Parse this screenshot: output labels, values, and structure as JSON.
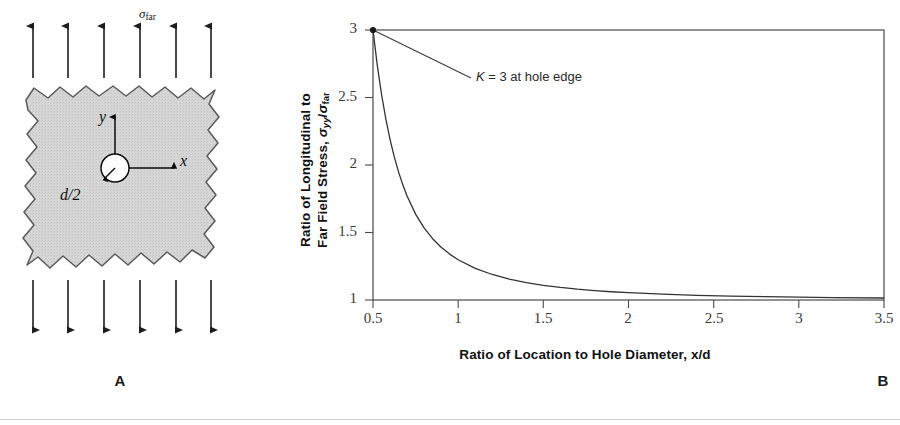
{
  "figure": {
    "panels": [
      {
        "id": "A",
        "label": "A",
        "caption_role": "plate-with-hole-schematic"
      },
      {
        "id": "B",
        "label": "B",
        "caption_role": "stress-ratio-plot"
      }
    ]
  },
  "panel_a": {
    "label": "A",
    "far_field_stress_label": {
      "symbol": "σ",
      "subscript": "far"
    },
    "axis_x_label": "x",
    "axis_y_label": "y",
    "radius_label": "d/2",
    "arrow_count_top": 6,
    "arrow_count_bottom": 6,
    "plate_fill": "#d4d4d4",
    "plate_stroke": "#555555",
    "hole_fill": "#ffffff"
  },
  "panel_b": {
    "label": "B",
    "annotation": {
      "italic_symbol": "K",
      "text": " = 3 at hole edge"
    },
    "marker_point": {
      "x": 0.5,
      "y": 3
    },
    "frame_color": "#4a4a4a",
    "curve_color": "#333333"
  },
  "chart_data": {
    "type": "line",
    "title": "",
    "xlabel_prefix": "Ratio of Location to Hole Diameter, ",
    "xlabel_italic": "x/d",
    "ylabel_line1": "Ratio of Longitudinal to",
    "ylabel_line2_prefix": "Far Field Stress, ",
    "ylabel_sigma": "σ",
    "ylabel_sub1": "yy",
    "ylabel_slash": "/",
    "ylabel_sub2": "far",
    "xlim": [
      0.5,
      3.5
    ],
    "ylim": [
      1,
      3
    ],
    "xticks": [
      "0.5",
      "1",
      "1.5",
      "2",
      "2.5",
      "3",
      "3.5"
    ],
    "xtick_values": [
      0.5,
      1,
      1.5,
      2,
      2.5,
      3,
      3.5
    ],
    "yticks": [
      "1",
      "1.5",
      "2",
      "2.5",
      "3"
    ],
    "ytick_values": [
      1,
      1.5,
      2,
      2.5,
      3
    ],
    "grid": false,
    "legend": null,
    "annotations": [
      {
        "text": "K = 3 at hole edge",
        "points_to": [
          0.5,
          3
        ]
      }
    ],
    "series": [
      {
        "name": "sigma_yy / sigma_far",
        "x": [
          0.5,
          0.525,
          0.55,
          0.575,
          0.6,
          0.625,
          0.65,
          0.675,
          0.7,
          0.75,
          0.8,
          0.85,
          0.9,
          0.95,
          1.0,
          1.1,
          1.2,
          1.3,
          1.4,
          1.5,
          1.6,
          1.7,
          1.8,
          1.9,
          2.0,
          2.2,
          2.4,
          2.6,
          2.8,
          3.0,
          3.2,
          3.5
        ],
        "y": [
          3.0,
          2.74,
          2.524,
          2.343,
          2.19,
          2.06,
          1.949,
          1.853,
          1.77,
          1.636,
          1.534,
          1.454,
          1.391,
          1.34,
          1.298,
          1.234,
          1.189,
          1.155,
          1.129,
          1.109,
          1.093,
          1.08,
          1.07,
          1.061,
          1.054,
          1.043,
          1.035,
          1.029,
          1.025,
          1.021,
          1.018,
          1.015
        ]
      }
    ]
  }
}
